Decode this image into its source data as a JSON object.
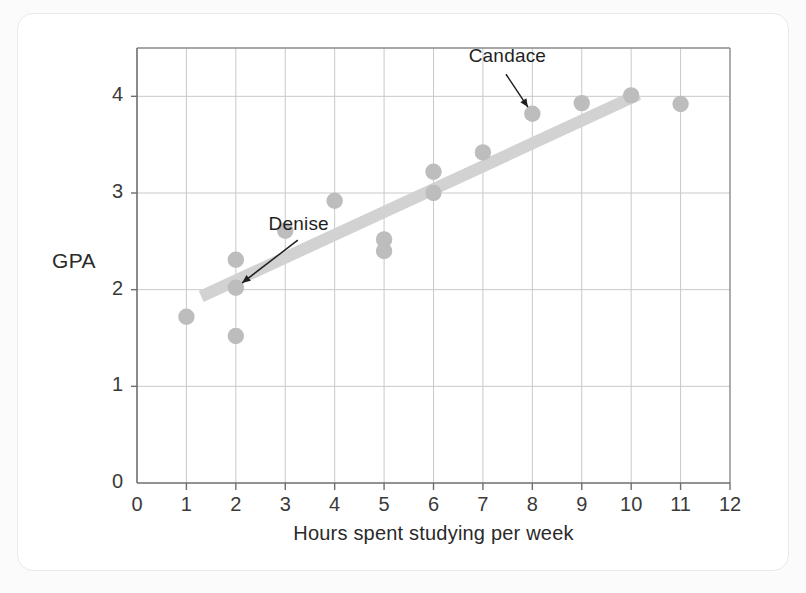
{
  "chart_data": {
    "type": "scatter",
    "title": "",
    "xlabel": "Hours spent studying per week",
    "ylabel": "GPA",
    "xlim": [
      0,
      12
    ],
    "ylim": [
      0,
      4.5
    ],
    "xticks": [
      "0",
      "1",
      "2",
      "3",
      "4",
      "5",
      "6",
      "7",
      "8",
      "9",
      "10",
      "11",
      "12"
    ],
    "yticks": [
      "0",
      "1",
      "2",
      "3",
      "4"
    ],
    "grid": true,
    "legend": "none",
    "points": [
      {
        "x": 1,
        "y": 1.72,
        "label": ""
      },
      {
        "x": 2,
        "y": 2.31,
        "label": ""
      },
      {
        "x": 2,
        "y": 2.02,
        "label": "Denise"
      },
      {
        "x": 2,
        "y": 1.52,
        "label": ""
      },
      {
        "x": 3,
        "y": 2.61,
        "label": ""
      },
      {
        "x": 4,
        "y": 2.92,
        "label": ""
      },
      {
        "x": 5,
        "y": 2.52,
        "label": ""
      },
      {
        "x": 5,
        "y": 2.4,
        "label": ""
      },
      {
        "x": 6,
        "y": 3.22,
        "label": ""
      },
      {
        "x": 6,
        "y": 3.0,
        "label": ""
      },
      {
        "x": 7,
        "y": 3.42,
        "label": ""
      },
      {
        "x": 8,
        "y": 3.82,
        "label": "Candace"
      },
      {
        "x": 9,
        "y": 3.93,
        "label": ""
      },
      {
        "x": 10,
        "y": 4.01,
        "label": ""
      },
      {
        "x": 11,
        "y": 3.92,
        "label": ""
      }
    ],
    "trend_line": {
      "x_start": 1.3,
      "y_start": 1.93,
      "x_end": 10.15,
      "y_end": 4.02
    },
    "annotations": [
      {
        "text": "Denise",
        "text_x": 3.35,
        "text_y": 2.55,
        "point_x": 2,
        "point_y": 2.02
      },
      {
        "text": "Candace",
        "text_x": 7.4,
        "text_y": 4.28,
        "point_x": 8,
        "point_y": 3.82
      }
    ],
    "colors": {
      "point": "#bdbdbd",
      "trend_line": "#d2d2d2",
      "grid": "#c9c9c9",
      "axis": "#6e6e6e",
      "text": "#2a2a2a"
    }
  }
}
